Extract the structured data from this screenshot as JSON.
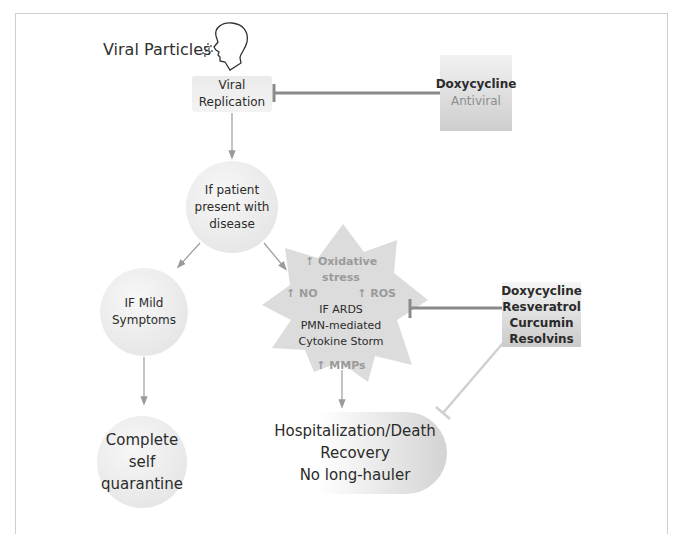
{
  "diagram": {
    "start": {
      "label": "Viral Particles",
      "icon": "person-exhaling-icon"
    },
    "viral_replication": {
      "lines": [
        "Viral",
        "Replication"
      ]
    },
    "inhibitor_top": {
      "drug": "Doxycycline",
      "role": "Antiviral"
    },
    "patient_node": {
      "lines": [
        "If patient",
        "present with",
        "disease"
      ]
    },
    "mild_node": {
      "lines": [
        "IF Mild",
        "Symptoms"
      ]
    },
    "quarantine_node": {
      "lines": [
        "Complete",
        "self",
        "quarantine"
      ]
    },
    "ards_node": {
      "markers": {
        "oxidative": "↑ Oxidative stress",
        "no": "↑ NO",
        "ros": "↑ ROS",
        "mmps": "↑ MMPs"
      },
      "lines": [
        "IF ARDS",
        "PMN-mediated",
        "Cytokine Storm"
      ]
    },
    "inhibitor_bottom": {
      "drugs": [
        "Doxycycline",
        "Resveratrol",
        "Curcumin",
        "Resolvins"
      ]
    },
    "outcome_node": {
      "lines": [
        "Hospitalization/Death",
        "Recovery",
        "No long-hauler"
      ]
    }
  },
  "colors": {
    "arrow": "#9a9a9a",
    "inhibitor": "#8a8a8a",
    "inhibitor_light": "#d0d0d0",
    "node_fill": "#e6e6e6",
    "marker_text": "#9a9a9a"
  }
}
